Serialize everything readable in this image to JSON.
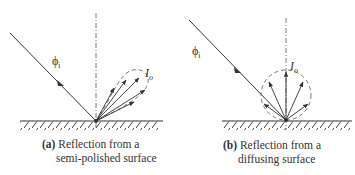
{
  "panels": [
    {
      "id": "a",
      "caption_tag": "(a)",
      "caption_line1": "Reflection from a",
      "caption_line2": "semi-polished surface",
      "incident_label": "ϕ",
      "incident_sub": "i",
      "reflected_label": "I",
      "reflected_sub": "o",
      "lobe_shape": "elongated-dashed-lobe",
      "arrow_count": 5
    },
    {
      "id": "b",
      "caption_tag": "(b)",
      "caption_line1": "Reflection from a",
      "caption_line2": "diffusing surface",
      "incident_label": "ϕ",
      "incident_sub": "i",
      "reflected_label": "I",
      "reflected_sub": "o",
      "lobe_shape": "dashed-circle",
      "arrow_count": 5
    }
  ],
  "colors": {
    "line": "#333333",
    "background": "#ffffff"
  }
}
